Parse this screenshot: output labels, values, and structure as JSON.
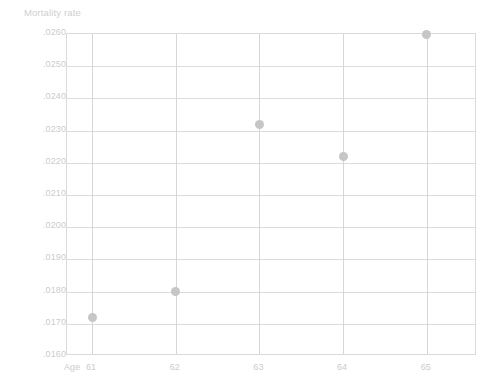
{
  "chart_data": {
    "type": "scatter",
    "title": "Mortality rate",
    "xlabel": "Age",
    "ylabel": "Mortality rate",
    "x": [
      61,
      62,
      63,
      64,
      65
    ],
    "values": [
      0.0172,
      0.018,
      0.0232,
      0.0222,
      0.026
    ],
    "point_labels": [
      ".0172",
      ".0180",
      ".0232",
      ".0222",
      ".0260"
    ],
    "categories": [
      "61",
      "62",
      "63",
      "64",
      "65"
    ],
    "xtick_labels": [
      "61",
      "62",
      "63",
      "64",
      "65"
    ],
    "ytick_labels": [
      ".0260",
      ".0250",
      ".0240",
      ".0230",
      ".0220",
      ".0210",
      ".0200",
      ".0190",
      ".0180",
      ".0170",
      ".0160"
    ],
    "ytick_values": [
      0.026,
      0.025,
      0.024,
      0.023,
      0.022,
      0.021,
      0.02,
      0.019,
      0.018,
      0.017,
      0.016
    ],
    "ylim": [
      0.016,
      0.026
    ],
    "xlim": [
      60.7,
      65.6
    ],
    "grid": true,
    "legend": false,
    "marker_color": "#c6c6c6",
    "grid_color": "#dcdcdc",
    "axis_color": "#dadada",
    "text_color": "#cccccc",
    "background_color": "#ffffff",
    "series": [
      {
        "name": "Mortality rate",
        "points": [
          {
            "x": 61,
            "y": 0.0172
          },
          {
            "x": 62,
            "y": 0.018
          },
          {
            "x": 63,
            "y": 0.0232
          },
          {
            "x": 64,
            "y": 0.0222
          },
          {
            "x": 65,
            "y": 0.026
          }
        ]
      }
    ]
  }
}
